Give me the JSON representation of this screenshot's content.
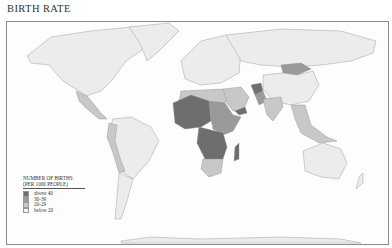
{
  "title": "BIRTH RATE",
  "legend": {
    "title_line1": "NUMBER OF BIRTHS",
    "title_line2": "(PER 1000 PEOPLE)",
    "items": [
      {
        "label": "above 40",
        "color": "#6e6e6e"
      },
      {
        "label": "30-39",
        "color": "#9a9a9a"
      },
      {
        "label": "20-29",
        "color": "#c8c8c8"
      },
      {
        "label": "below 20",
        "color": "#f2f2f2"
      }
    ]
  },
  "colors": {
    "above40": "#6e6e6e",
    "c30": "#9a9a9a",
    "c20": "#c8c8c8",
    "below20": "#ececec",
    "border": "#8a8a8a"
  }
}
